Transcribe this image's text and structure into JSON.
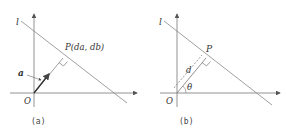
{
  "panels": [
    {
      "id": "a",
      "caption": "(a)",
      "line_label": "l",
      "point_label": "P(da, db)",
      "vector_label": "a",
      "origin_label": "O"
    },
    {
      "id": "b",
      "caption": "(b)",
      "line_label": "l",
      "point_label": "P",
      "distance_label": "d",
      "angle_label": "θ",
      "origin_label": "O"
    }
  ],
  "colors": {
    "line": "#777777",
    "text": "#333333"
  }
}
